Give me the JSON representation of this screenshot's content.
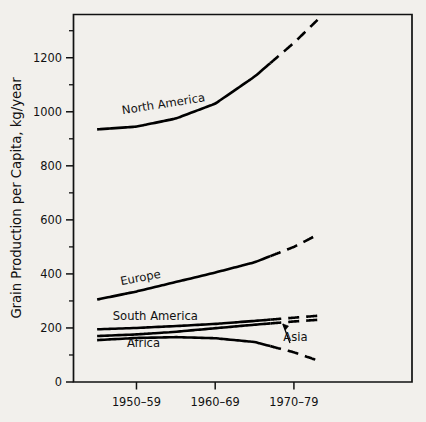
{
  "chart_data": {
    "type": "line",
    "title": "",
    "xlabel": "",
    "ylabel": "Grain Production per Capita, kg/year",
    "categories": [
      "1950–59",
      "1960–69",
      "1970–79"
    ],
    "xlim": [
      1947,
      1990
    ],
    "ylim": [
      0,
      1360
    ],
    "ytick_labels": [
      "0",
      "200",
      "400",
      "600",
      "800",
      "1000",
      "1200"
    ],
    "ytick_values": [
      0,
      200,
      400,
      600,
      800,
      1000,
      1200
    ],
    "ytick_minor_values": [
      100,
      300,
      500,
      700,
      900,
      1100,
      1300
    ],
    "xtick_values": [
      1955,
      1965,
      1975
    ],
    "grid": false,
    "legend": "inline-labels",
    "note": "Solid segments are historical data; dashed segments are projections beyond 1970–79.",
    "series": [
      {
        "name": "North America",
        "label": "North America",
        "label_x": 1958.5,
        "label_y": 1015,
        "label_rotation": -9,
        "x": [
          1950,
          1955,
          1960,
          1965,
          1970,
          1975,
          1978
        ],
        "values": [
          935,
          945,
          975,
          1030,
          1130,
          1255,
          1340
        ],
        "solid_until": 1972,
        "style": "solid-then-dashed"
      },
      {
        "name": "Europe",
        "label": "Europe",
        "label_x": 1955.6,
        "label_y": 372,
        "label_rotation": -11,
        "x": [
          1950,
          1955,
          1960,
          1965,
          1970,
          1975,
          1978
        ],
        "values": [
          305,
          335,
          370,
          405,
          443,
          500,
          545
        ],
        "solid_until": 1972,
        "style": "solid-then-dashed"
      },
      {
        "name": "South America",
        "label": "South America",
        "label_x": 1957.4,
        "label_y": 228,
        "label_rotation": 0,
        "x": [
          1950,
          1955,
          1960,
          1965,
          1970,
          1975,
          1978
        ],
        "values": [
          195,
          200,
          207,
          215,
          226,
          238,
          245
        ],
        "solid_until": 1972,
        "style": "solid-then-dashed"
      },
      {
        "name": "Asia",
        "label": "Asia",
        "label_x": 1975.2,
        "label_y": 150,
        "label_rotation": 0,
        "x": [
          1950,
          1955,
          1960,
          1965,
          1970,
          1975,
          1978
        ],
        "values": [
          170,
          176,
          186,
          199,
          212,
          224,
          230
        ],
        "solid_until": 1972,
        "style": "solid-then-dashed",
        "annotation": "arrow from label to line"
      },
      {
        "name": "Africa",
        "label": "Africa",
        "label_x": 1955.9,
        "label_y": 128,
        "label_rotation": 0,
        "x": [
          1950,
          1955,
          1960,
          1965,
          1970,
          1975,
          1978
        ],
        "values": [
          155,
          163,
          166,
          162,
          148,
          110,
          80
        ],
        "solid_until": 1972,
        "style": "solid-then-dashed"
      }
    ]
  }
}
